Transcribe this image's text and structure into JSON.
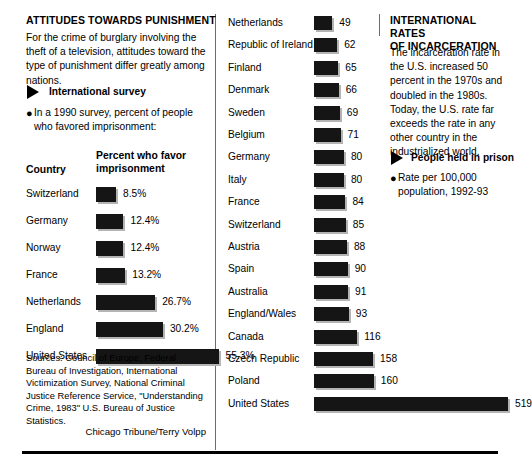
{
  "left_panel": {
    "headline": "ATTITUDES TOWARDS PUNISHMENT",
    "intro": "For the crime of burglary involving the theft of a television, attitudes toward the type of punishment differ greatly among nations.",
    "section_marker_icon": "right-triangle-icon",
    "section_title": "International survey",
    "bullet_icon": "bullet-dot-icon",
    "bullet_text": "In a 1990 survey, percent of people who favored imprisonment:",
    "col_head_country": "Country",
    "col_head_value_line1": "Percent who favor",
    "col_head_value_line2": "imprisonment",
    "sources": "Sources: Council of Europe, Federal Bureau of Investigation, International Victimization Survey, National Criminal Justice Reference Service, \"Understanding Crime, 1983\" U.S. Bureau of Justice Statistics.",
    "credit": "Chicago Tribune/Terry Volpp"
  },
  "right_panel": {
    "headline_line1": "INTERNATIONAL RATES",
    "headline_line2": "OF INCARCERATION",
    "intro": "The incarceration rate in the U.S. increased 50 percent in the 1970s and doubled in the 1980s. Today, the U.S. rate far exceeds the rate in any other country in the industrialized world.",
    "section_marker_icon": "right-triangle-icon",
    "section_title": "People held in prison",
    "bullet_icon": "bullet-dot-icon",
    "bullet_text_line1": "Rate per 100,000",
    "bullet_text_line2": "population, 1992-93"
  },
  "colors": {
    "bar": "#151515",
    "bar_shadow": "#b4b4b4",
    "divider": "#6d6d6d",
    "rule": "#000000",
    "background": "#ffffff"
  },
  "chart_data": [
    {
      "type": "bar",
      "id": "attitudes-survey",
      "title": "Percent who favor imprisonment",
      "xlabel": "",
      "ylabel": "Country",
      "orientation": "horizontal",
      "grid": false,
      "legend": "none",
      "xlim": [
        0,
        60
      ],
      "categories": [
        "Switzerland",
        "Germany",
        "Norway",
        "France",
        "Netherlands",
        "England",
        "United States"
      ],
      "values": [
        8.5,
        12.4,
        12.4,
        13.2,
        26.7,
        30.2,
        55.3
      ],
      "value_labels": [
        "8.5%",
        "12.4%",
        "12.4%",
        "13.2%",
        "26.7%",
        "30.2%",
        "55.3%"
      ],
      "unit": "%"
    },
    {
      "type": "bar",
      "id": "incarceration-rates",
      "title": "Rate per 100,000 population, 1992-93",
      "xlabel": "",
      "ylabel": "",
      "orientation": "horizontal",
      "grid": false,
      "legend": "none",
      "xlim": [
        0,
        519
      ],
      "categories": [
        "Netherlands",
        "Republic of Ireland",
        "Finland",
        "Denmark",
        "Sweden",
        "Belgium",
        "Germany",
        "Italy",
        "France",
        "Switzerland",
        "Austria",
        "Spain",
        "Australia",
        "England/Wales",
        "Canada",
        "Czech Republic",
        "Poland",
        "United States"
      ],
      "values": [
        49,
        62,
        65,
        66,
        69,
        71,
        80,
        80,
        84,
        85,
        88,
        90,
        91,
        93,
        116,
        158,
        160,
        519
      ],
      "value_labels": [
        "49",
        "62",
        "65",
        "66",
        "69",
        "71",
        "80",
        "80",
        "84",
        "85",
        "88",
        "90",
        "91",
        "93",
        "116",
        "158",
        "160",
        "519"
      ],
      "unit": "per 100,000"
    }
  ]
}
